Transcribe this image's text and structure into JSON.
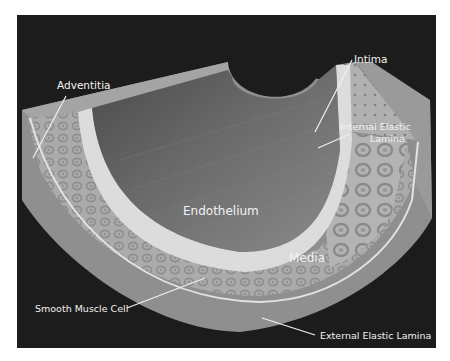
{
  "figure": {
    "background_color": "#1c1c1c",
    "labels": {
      "adventitia": "Adventitia",
      "intima": "Intima",
      "internal_elastic_lamina_line1": "Internal Elastic",
      "internal_elastic_lamina_line2": "Lamina",
      "endothelium": "Endothelium",
      "media": "Media",
      "smooth_muscle_cell": "Smooth Muscle Cell",
      "external_elastic_lamina": "External Elastic Lamina"
    },
    "layers": [
      {
        "name": "Endothelium",
        "color": "#7a7a7a"
      },
      {
        "name": "Intima",
        "color": "#d8d8d8"
      },
      {
        "name": "Internal Elastic Lamina",
        "color": "#e6e6e6"
      },
      {
        "name": "Media",
        "color": "#a8a8a8"
      },
      {
        "name": "External Elastic Lamina",
        "color": "#e0e0e0"
      },
      {
        "name": "Adventitia",
        "color": "#909090"
      }
    ]
  }
}
